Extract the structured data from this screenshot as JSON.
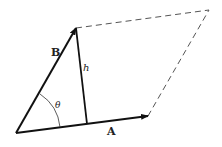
{
  "diagram": {
    "type": "parallelogram-vector-area",
    "labels": {
      "vector_a": "A",
      "vector_b": "B",
      "height": "h",
      "angle": "θ"
    },
    "points": {
      "origin": [
        16,
        133
      ],
      "a_tip": [
        148,
        116
      ],
      "b_tip": [
        76,
        28
      ],
      "far_corner": [
        209,
        10
      ],
      "h_foot": [
        87,
        124
      ]
    },
    "colors": {
      "stroke": "#111111",
      "dashed": "#555555"
    }
  }
}
